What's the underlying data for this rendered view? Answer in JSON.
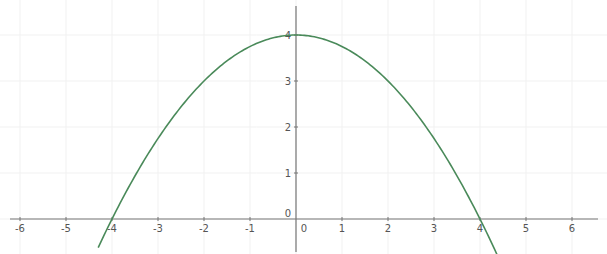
{
  "chart_data": {
    "type": "line",
    "title": "",
    "xlabel": "",
    "ylabel": "",
    "function": "y = 4 - x^2/4",
    "xlim": [
      -6.5,
      6.5
    ],
    "ylim": [
      -0.7,
      4.6
    ],
    "grid": true,
    "legend": null,
    "x_ticks": [
      "-6",
      "-5",
      "-4",
      "-3",
      "-2",
      "-1",
      "0",
      "1",
      "2",
      "3",
      "4",
      "5",
      "6"
    ],
    "y_ticks": [
      "0",
      "1",
      "2",
      "3",
      "4"
    ],
    "series": [
      {
        "name": "parabola",
        "color": "#4a8a5a",
        "x": [
          -4.3,
          -4,
          -3,
          -2,
          -1,
          0,
          1,
          2,
          3,
          4,
          4.4
        ],
        "y": [
          -0.62,
          0,
          1.75,
          3,
          3.75,
          4,
          3.75,
          3,
          1.75,
          0,
          -0.84
        ]
      }
    ],
    "annotations": [
      "x-intercepts at -4 and 4",
      "maximum at (0, 4)"
    ]
  },
  "style": {
    "axis_color": "#777777",
    "grid_color": "#f1f1f1",
    "curve_color": "#4a8a5a"
  },
  "layout": {
    "origin_px": [
      296,
      219
    ],
    "unit_px": 46,
    "x_axis_px": [
      10,
      598
    ],
    "y_axis_px": [
      6,
      252
    ]
  }
}
